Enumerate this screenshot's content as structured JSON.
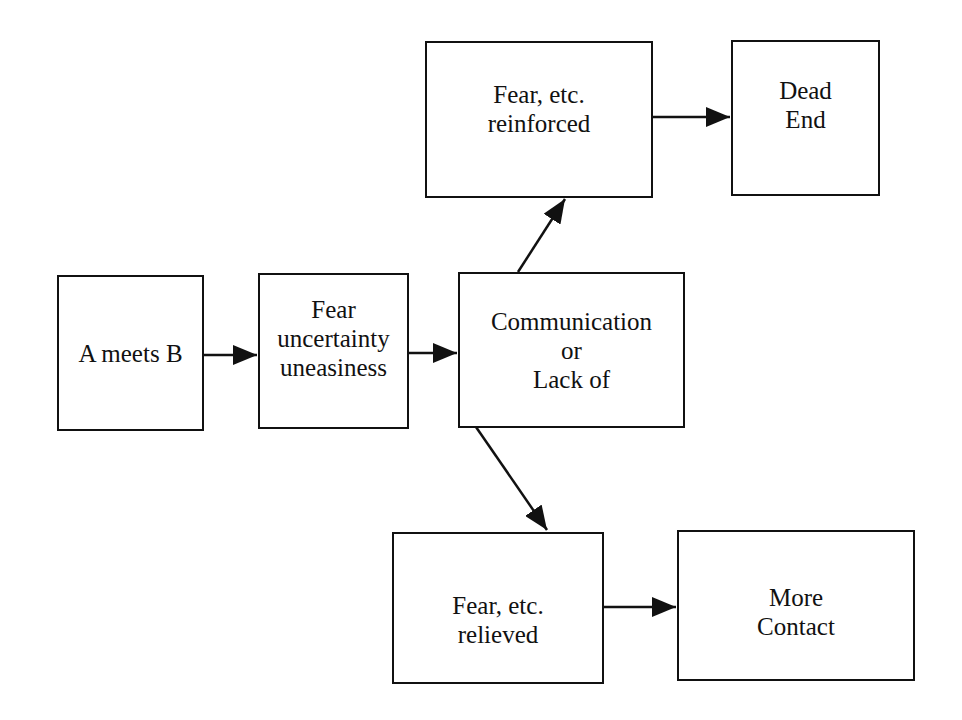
{
  "diagram": {
    "nodes": [
      {
        "id": "a_meets_b",
        "lines": [
          "A meets B"
        ]
      },
      {
        "id": "fear_uncertainty",
        "lines": [
          "Fear",
          "uncertainty",
          "uneasiness"
        ]
      },
      {
        "id": "communication",
        "lines": [
          "Communication",
          "or",
          "Lack of"
        ]
      },
      {
        "id": "fear_reinforced",
        "lines": [
          "Fear, etc.",
          "reinforced"
        ]
      },
      {
        "id": "dead_end",
        "lines": [
          "Dead",
          "End"
        ]
      },
      {
        "id": "fear_relieved",
        "lines": [
          "Fear, etc.",
          "relieved"
        ]
      },
      {
        "id": "more_contact",
        "lines": [
          "More",
          "Contact"
        ]
      }
    ],
    "edges": [
      {
        "from": "a_meets_b",
        "to": "fear_uncertainty"
      },
      {
        "from": "fear_uncertainty",
        "to": "communication"
      },
      {
        "from": "communication",
        "to": "fear_reinforced"
      },
      {
        "from": "fear_reinforced",
        "to": "dead_end"
      },
      {
        "from": "communication",
        "to": "fear_relieved"
      },
      {
        "from": "fear_relieved",
        "to": "more_contact"
      }
    ],
    "colors": {
      "stroke": "#111111",
      "background": "#ffffff"
    }
  }
}
